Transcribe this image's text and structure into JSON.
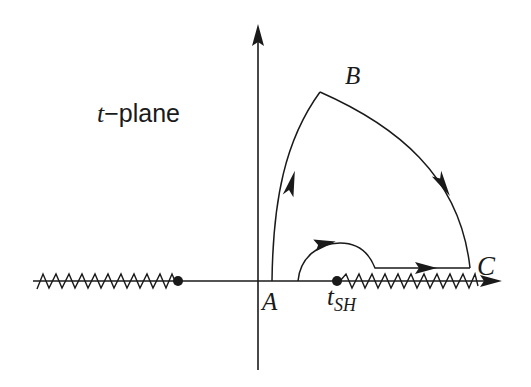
{
  "figure": {
    "plane_label": {
      "variable": "t",
      "dash": "−",
      "word": "plane"
    },
    "points": {
      "A": "A",
      "B": "B",
      "C": "C",
      "saddle": {
        "base": "t",
        "subscript": "SH"
      }
    }
  },
  "colors": {
    "ink": "#1a1a1a",
    "background": "#ffffff"
  },
  "geometry": {
    "real_axis_y": 281,
    "imag_axis_x": 258,
    "left_branch_point_x": 178,
    "saddle_point_x": 337,
    "point_A": [
      272,
      281
    ],
    "point_B": [
      320,
      92
    ],
    "point_C": [
      470,
      268
    ],
    "left_cut": [
      37,
      175
    ],
    "right_cut": [
      340,
      478
    ]
  }
}
